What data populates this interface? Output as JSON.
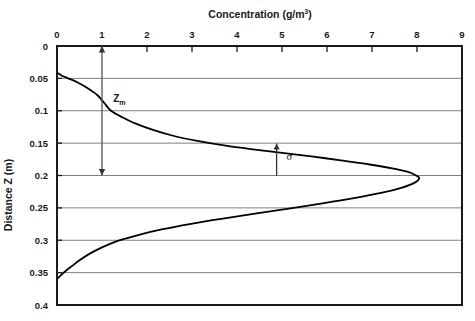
{
  "chart_data": {
    "type": "line",
    "title": "",
    "xlabel": "Concentration (g/m3)",
    "xlabel_base": "Concentration (g/m",
    "xlabel_sup": "3",
    "xlabel_close": ")",
    "ylabel": "Distance Z (m)",
    "xlim": [
      0,
      9
    ],
    "ylim": [
      0,
      0.4
    ],
    "y_inverted": true,
    "grid": "horizontal",
    "legend": "none",
    "xticks": [
      "0",
      "1",
      "2",
      "3",
      "4",
      "5",
      "6",
      "7",
      "8",
      "9"
    ],
    "xtick_values": [
      0,
      1,
      2,
      3,
      4,
      5,
      6,
      7,
      8,
      9
    ],
    "yticks": [
      "0",
      "0.05",
      "0.1",
      "0.15",
      "0.2",
      "0.25",
      "0.3",
      "0.35",
      "0.4"
    ],
    "ytick_values": [
      0,
      0.05,
      0.1,
      0.15,
      0.2,
      0.25,
      0.3,
      0.35,
      0.4
    ],
    "series": [
      {
        "name": "concentration-profile",
        "color": "#000000",
        "points": [
          [
            0.02,
            0.042
          ],
          [
            0.1,
            0.0455
          ],
          [
            0.25,
            0.05
          ],
          [
            0.45,
            0.056
          ],
          [
            0.7,
            0.066
          ],
          [
            0.9,
            0.076
          ],
          [
            1.05,
            0.088
          ],
          [
            1.2,
            0.1
          ],
          [
            1.45,
            0.11
          ],
          [
            1.75,
            0.12
          ],
          [
            2.15,
            0.13
          ],
          [
            2.6,
            0.139
          ],
          [
            3.15,
            0.147
          ],
          [
            3.75,
            0.154
          ],
          [
            4.4,
            0.16
          ],
          [
            5.05,
            0.1655
          ],
          [
            5.7,
            0.171
          ],
          [
            6.35,
            0.177
          ],
          [
            6.95,
            0.183
          ],
          [
            7.45,
            0.189
          ],
          [
            7.8,
            0.1945
          ],
          [
            7.98,
            0.2
          ],
          [
            8.05,
            0.204
          ],
          [
            7.95,
            0.211
          ],
          [
            7.65,
            0.219
          ],
          [
            7.2,
            0.227
          ],
          [
            6.6,
            0.235
          ],
          [
            5.9,
            0.243
          ],
          [
            5.15,
            0.251
          ],
          [
            4.4,
            0.259
          ],
          [
            3.65,
            0.267
          ],
          [
            2.95,
            0.275
          ],
          [
            2.35,
            0.283
          ],
          [
            1.8,
            0.292
          ],
          [
            1.35,
            0.301
          ],
          [
            1.0,
            0.311
          ],
          [
            0.72,
            0.321
          ],
          [
            0.5,
            0.331
          ],
          [
            0.33,
            0.34
          ],
          [
            0.2,
            0.347
          ],
          [
            0.1,
            0.353
          ],
          [
            0.03,
            0.358
          ]
        ]
      }
    ],
    "annotations": [
      {
        "name": "zm-measure",
        "label": "Z",
        "sublabel": "m",
        "type": "double-arrow-vertical",
        "x": 1.0,
        "y_from": 0.0,
        "y_to": 0.2,
        "label_x": 1.25,
        "label_y": 0.087
      },
      {
        "name": "sigma-measure",
        "label": "σ",
        "type": "single-arrow-up",
        "x": 4.88,
        "y_from": 0.2,
        "y_to": 0.1505,
        "label_x": 5.1,
        "label_y": 0.176
      }
    ]
  },
  "colors": {
    "curve": "#000000",
    "gridline": "#808080",
    "axis": "#1a1a1a",
    "background": "#ffffff",
    "text": "#1a1a1a"
  }
}
